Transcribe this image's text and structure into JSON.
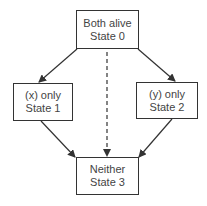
{
  "diagram": {
    "type": "state-transition",
    "colors": {
      "line": "#333333",
      "text": "#444444",
      "background": "#ffffff"
    },
    "nodes": [
      {
        "id": "s0",
        "line1": "Both alive",
        "line2": "State 0"
      },
      {
        "id": "s1",
        "line1": "(x) only",
        "line2": "State 1"
      },
      {
        "id": "s2",
        "line1": "(y) only",
        "line2": "State 2"
      },
      {
        "id": "s3",
        "line1": "Neither",
        "line2": "State 3"
      }
    ],
    "edges": [
      {
        "from": "s0",
        "to": "s1",
        "style": "solid"
      },
      {
        "from": "s0",
        "to": "s2",
        "style": "solid"
      },
      {
        "from": "s0",
        "to": "s3",
        "style": "dashed"
      },
      {
        "from": "s1",
        "to": "s3",
        "style": "solid"
      },
      {
        "from": "s2",
        "to": "s3",
        "style": "solid"
      }
    ]
  }
}
